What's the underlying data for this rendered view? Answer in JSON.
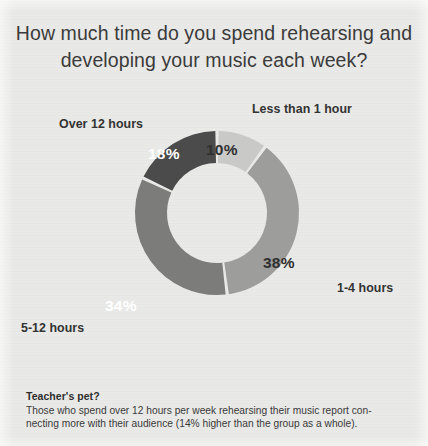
{
  "title": {
    "line1": "How much time do you spend rehearsing and",
    "line2": "developing your music each week?"
  },
  "chart_data": {
    "type": "pie",
    "variant": "donut",
    "title": "How much time do you spend rehearsing and developing your music each week?",
    "categories": [
      "Less than 1 hour",
      "1-4 hours",
      "5-12 hours",
      "Over 12 hours"
    ],
    "values": [
      10,
      38,
      34,
      18
    ],
    "value_labels": [
      "10%",
      "38%",
      "34%",
      "18%"
    ],
    "unit": "percent",
    "start_angle_deg": 0,
    "direction": "clockwise",
    "colors": [
      "#c9c9c7",
      "#9d9d9b",
      "#7c7c7a",
      "#4b4b4b"
    ],
    "label_colors": [
      "#303030",
      "#303030",
      "#ffffff",
      "#ffffff"
    ],
    "legend": "none",
    "grid": false,
    "slices": [
      {
        "label": "Less than 1 hour",
        "value": 10,
        "display": "10%",
        "color": "#c9c9c7"
      },
      {
        "label": "1-4 hours",
        "value": 38,
        "display": "38%",
        "color": "#9d9d9b"
      },
      {
        "label": "5-12 hours",
        "value": 34,
        "display": "34%",
        "color": "#7c7c7a"
      },
      {
        "label": "Over 12 hours",
        "value": 18,
        "display": "18%",
        "color": "#4b4b4b"
      }
    ]
  },
  "caption": {
    "heading": "Teacher's pet?",
    "line1": "Those who spend over 12 hours per week rehearsing their music report con-",
    "line2": "necting more with their audience (14% higher than the group as a whole)."
  }
}
